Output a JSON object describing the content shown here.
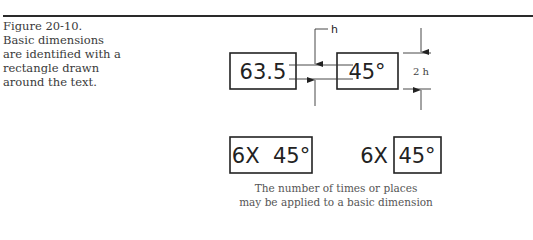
{
  "figure": {
    "number": "Figure 20-10.",
    "caption_lines": [
      "Basic dimensions",
      "are identified with a",
      "rectangle drawn",
      "around the text."
    ]
  },
  "diagram": {
    "top_example": {
      "box1_text": "63.5",
      "box2_text": "45°",
      "text_height_label": "h",
      "frame_height_label": "2 h"
    },
    "bottom_example": {
      "left_box_text": "6X  45°",
      "right_prefix_text": "6X",
      "right_box_text": "45°"
    },
    "note_lines": [
      "The number of times or places",
      "may be applied to a basic dimension"
    ]
  },
  "colors": {
    "line": "#222222",
    "text": "#3a3a3a"
  }
}
